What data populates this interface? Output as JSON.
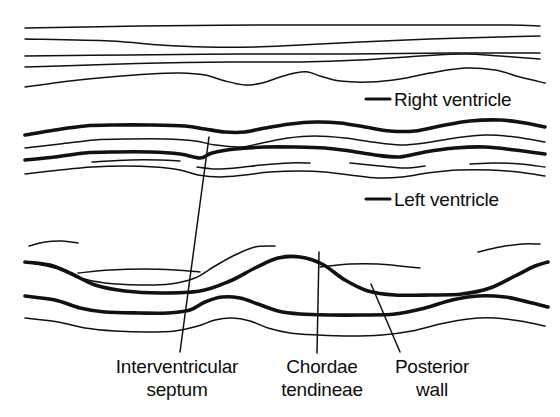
{
  "figure": {
    "kind": "m-mode-echocardiogram-tracing",
    "background_color": "#ffffff",
    "ink_color": "#111111"
  },
  "legend_labels": [
    {
      "id": "right-ventricle",
      "text": "Right ventricle",
      "leader": "horizontal-dash"
    },
    {
      "id": "left-ventricle",
      "text": "Left ventricle",
      "leader": "horizontal-dash"
    }
  ],
  "callout_labels": [
    {
      "id": "interventricular-septum",
      "line1": "Interventricular",
      "line2": "septum",
      "leader": "diagonal-up-right"
    },
    {
      "id": "chordae-tendineae",
      "line1": "Chordae",
      "line2": "tendineae",
      "leader": "vertical"
    },
    {
      "id": "posterior-wall",
      "line1": "Posterior",
      "line2": "wall",
      "leader": "diagonal-up-left"
    }
  ],
  "chart_data": {
    "type": "line",
    "title": "",
    "xlabel": "",
    "ylabel": "",
    "xlim": [
      0,
      560
    ],
    "ylim": [
      0,
      417
    ],
    "grid": false,
    "legend_position": "right",
    "series": [
      {
        "name": "chest-wall-echo-1",
        "weight": "thin",
        "points": [
          [
            25,
            28
          ],
          [
            140,
            26
          ],
          [
            260,
            25
          ],
          [
            380,
            25
          ],
          [
            500,
            25
          ],
          [
            540,
            26
          ]
        ]
      },
      {
        "name": "chest-wall-echo-2",
        "weight": "thin",
        "points": [
          [
            25,
            39
          ],
          [
            110,
            41
          ],
          [
            160,
            45
          ],
          [
            205,
            47
          ],
          [
            255,
            47
          ],
          [
            300,
            45
          ],
          [
            360,
            42
          ],
          [
            430,
            39
          ],
          [
            500,
            37
          ],
          [
            540,
            36
          ]
        ]
      },
      {
        "name": "right-ventricle-anterior-wall",
        "weight": "thin",
        "points": [
          [
            25,
            56
          ],
          [
            130,
            55
          ],
          [
            240,
            54
          ],
          [
            350,
            54
          ],
          [
            450,
            53
          ],
          [
            540,
            53
          ]
        ]
      },
      {
        "name": "right-ventricle-cavity-echo",
        "weight": "thin",
        "points": [
          [
            25,
            67
          ],
          [
            90,
            65
          ],
          [
            160,
            63
          ],
          [
            230,
            62
          ],
          [
            300,
            62
          ],
          [
            360,
            60
          ],
          [
            420,
            56
          ],
          [
            465,
            54
          ],
          [
            500,
            56
          ],
          [
            540,
            59
          ]
        ]
      },
      {
        "name": "interventricular-septum-upper",
        "weight": "thin",
        "points": [
          [
            25,
            87
          ],
          [
            70,
            81
          ],
          [
            110,
            77
          ],
          [
            150,
            74
          ],
          [
            180,
            73
          ],
          [
            205,
            75
          ],
          [
            225,
            81
          ],
          [
            245,
            85
          ],
          [
            262,
            83
          ],
          [
            280,
            77
          ],
          [
            295,
            73
          ],
          [
            308,
            72
          ],
          [
            320,
            76
          ],
          [
            340,
            81
          ],
          [
            370,
            82
          ],
          [
            400,
            79
          ],
          [
            430,
            73
          ],
          [
            465,
            68
          ],
          [
            495,
            70
          ],
          [
            520,
            77
          ],
          [
            545,
            83
          ]
        ]
      },
      {
        "name": "lv-posterior-septum-thick",
        "weight": "thick",
        "points": [
          [
            25,
            135
          ],
          [
            55,
            130
          ],
          [
            85,
            126
          ],
          [
            115,
            125
          ],
          [
            150,
            125
          ],
          [
            185,
            126
          ],
          [
            205,
            129
          ],
          [
            225,
            132
          ],
          [
            245,
            132
          ],
          [
            265,
            128
          ],
          [
            290,
            124
          ],
          [
            315,
            122
          ],
          [
            340,
            123
          ],
          [
            365,
            127
          ],
          [
            390,
            131
          ],
          [
            415,
            131
          ],
          [
            440,
            126
          ],
          [
            470,
            121
          ],
          [
            500,
            120
          ],
          [
            525,
            123
          ],
          [
            545,
            127
          ]
        ]
      },
      {
        "name": "lv-septum-echo-thin",
        "weight": "thin",
        "points": [
          [
            25,
            148
          ],
          [
            60,
            144
          ],
          [
            95,
            140
          ],
          [
            130,
            139
          ],
          [
            165,
            139
          ],
          [
            195,
            141
          ],
          [
            215,
            145
          ],
          [
            240,
            147
          ],
          [
            262,
            143
          ],
          [
            288,
            138
          ],
          [
            315,
            136
          ],
          [
            345,
            138
          ],
          [
            372,
            142
          ],
          [
            400,
            145
          ],
          [
            425,
            143
          ],
          [
            455,
            138
          ],
          [
            485,
            135
          ],
          [
            515,
            137
          ],
          [
            545,
            142
          ]
        ]
      },
      {
        "name": "lv-chordae-thick",
        "weight": "thick",
        "points": [
          [
            25,
            160
          ],
          [
            55,
            157
          ],
          [
            85,
            153
          ],
          [
            115,
            152
          ],
          [
            150,
            152
          ],
          [
            180,
            154
          ],
          [
            200,
            158
          ],
          [
            212,
            153
          ],
          [
            235,
            149
          ],
          [
            265,
            147
          ],
          [
            295,
            147
          ],
          [
            325,
            148
          ],
          [
            350,
            151
          ],
          [
            375,
            155
          ],
          [
            400,
            157
          ],
          [
            425,
            152
          ],
          [
            455,
            148
          ],
          [
            485,
            147
          ],
          [
            515,
            150
          ],
          [
            545,
            154
          ]
        ]
      },
      {
        "name": "lv-posterior-thin-a",
        "weight": "thin",
        "points": [
          [
            92,
            162
          ],
          [
            130,
            160
          ],
          [
            160,
            160
          ],
          [
            180,
            161
          ]
        ]
      },
      {
        "name": "lv-posterior-thin-b",
        "weight": "thin",
        "points": [
          [
            197,
            167
          ],
          [
            215,
            169
          ],
          [
            235,
            168
          ],
          [
            262,
            165
          ],
          [
            290,
            163
          ],
          [
            310,
            163
          ]
        ]
      },
      {
        "name": "lv-posterior-thin-c",
        "weight": "thin",
        "points": [
          [
            350,
            163
          ],
          [
            380,
            166
          ],
          [
            405,
            168
          ],
          [
            425,
            166
          ]
        ]
      },
      {
        "name": "lv-posterior-thin-d",
        "weight": "thin",
        "points": [
          [
            470,
            164
          ],
          [
            495,
            163
          ],
          [
            520,
            164
          ],
          [
            545,
            167
          ]
        ]
      },
      {
        "name": "lv-lower-boundary-thin",
        "weight": "thin",
        "points": [
          [
            25,
            174
          ],
          [
            60,
            170
          ],
          [
            92,
            167
          ],
          [
            125,
            166
          ],
          [
            155,
            167
          ],
          [
            180,
            170
          ],
          [
            198,
            175
          ],
          [
            220,
            177
          ],
          [
            245,
            175
          ],
          [
            270,
            172
          ],
          [
            300,
            171
          ],
          [
            325,
            172
          ],
          [
            350,
            175
          ],
          [
            378,
            178
          ],
          [
            402,
            177
          ],
          [
            428,
            173
          ],
          [
            458,
            170
          ],
          [
            490,
            170
          ],
          [
            518,
            172
          ],
          [
            545,
            176
          ]
        ]
      },
      {
        "name": "septum-upper-fragment-a",
        "weight": "thin",
        "points": [
          [
            29,
            246
          ],
          [
            45,
            242
          ],
          [
            62,
            241
          ],
          [
            78,
            243
          ]
        ]
      },
      {
        "name": "septum-thin-upper",
        "weight": "thin",
        "points": [
          [
            25,
            262
          ],
          [
            55,
            268
          ],
          [
            80,
            278
          ],
          [
            105,
            283
          ],
          [
            140,
            285
          ],
          [
            170,
            284
          ],
          [
            195,
            278
          ],
          [
            215,
            266
          ],
          [
            235,
            255
          ],
          [
            255,
            247
          ],
          [
            275,
            246
          ]
        ]
      },
      {
        "name": "septum-thin-mid-fragment",
        "weight": "thin",
        "points": [
          [
            78,
            273
          ],
          [
            110,
            270
          ],
          [
            145,
            269
          ],
          [
            175,
            270
          ],
          [
            200,
            272
          ]
        ]
      },
      {
        "name": "interventricular-septum-thick",
        "weight": "thick",
        "points": [
          [
            25,
            262
          ],
          [
            50,
            265
          ],
          [
            72,
            274
          ],
          [
            95,
            285
          ],
          [
            125,
            291
          ],
          [
            160,
            293
          ],
          [
            200,
            291
          ],
          [
            230,
            281
          ],
          [
            255,
            268
          ],
          [
            278,
            258
          ],
          [
            300,
            257
          ],
          [
            322,
            264
          ],
          [
            345,
            280
          ],
          [
            368,
            291
          ],
          [
            395,
            295
          ],
          [
            430,
            295
          ],
          [
            462,
            294
          ],
          [
            490,
            288
          ],
          [
            515,
            276
          ],
          [
            535,
            266
          ],
          [
            548,
            262
          ]
        ]
      },
      {
        "name": "septum-echo-fragment-right",
        "weight": "thin",
        "points": [
          [
            320,
            267
          ],
          [
            350,
            264
          ],
          [
            378,
            264
          ],
          [
            400,
            266
          ],
          [
            420,
            268
          ]
        ]
      },
      {
        "name": "septum-echo-fragment-far-right",
        "weight": "thin",
        "points": [
          [
            478,
            252
          ],
          [
            500,
            247
          ],
          [
            522,
            244
          ],
          [
            540,
            244
          ]
        ]
      },
      {
        "name": "chordae-thick-lower",
        "weight": "thick",
        "points": [
          [
            25,
            296
          ],
          [
            55,
            300
          ],
          [
            80,
            308
          ],
          [
            105,
            312
          ],
          [
            140,
            313
          ],
          [
            168,
            313
          ],
          [
            190,
            310
          ],
          [
            205,
            302
          ],
          [
            222,
            297
          ],
          [
            240,
            298
          ],
          [
            258,
            304
          ],
          [
            278,
            311
          ],
          [
            300,
            314
          ],
          [
            330,
            315
          ],
          [
            362,
            315
          ],
          [
            395,
            314
          ],
          [
            425,
            308
          ],
          [
            452,
            300
          ],
          [
            478,
            296
          ],
          [
            505,
            297
          ],
          [
            528,
            302
          ],
          [
            548,
            307
          ]
        ]
      },
      {
        "name": "posterior-wall-thin",
        "weight": "thin",
        "points": [
          [
            25,
            318
          ],
          [
            58,
            322
          ],
          [
            85,
            328
          ],
          [
            115,
            331
          ],
          [
            148,
            332
          ],
          [
            175,
            331
          ],
          [
            198,
            326
          ],
          [
            215,
            320
          ],
          [
            232,
            318
          ],
          [
            250,
            321
          ],
          [
            268,
            328
          ],
          [
            290,
            333
          ],
          [
            318,
            335
          ],
          [
            350,
            336
          ],
          [
            382,
            335
          ],
          [
            412,
            331
          ],
          [
            440,
            324
          ],
          [
            468,
            319
          ],
          [
            495,
            318
          ],
          [
            520,
            321
          ],
          [
            545,
            326
          ]
        ]
      }
    ],
    "leaders": [
      {
        "name": "right-ventricle-leader",
        "from": [
          366,
          99
        ],
        "to": [
          390,
          99
        ],
        "weight": "thick"
      },
      {
        "name": "left-ventricle-leader",
        "from": [
          366,
          199
        ],
        "to": [
          390,
          199
        ],
        "weight": "thick"
      },
      {
        "name": "interventricular-septum-leader",
        "from": [
          209,
          137
        ],
        "to": [
          180,
          352
        ],
        "weight": "thin"
      },
      {
        "name": "chordae-tendineae-leader",
        "from": [
          319,
          252
        ],
        "to": [
          317,
          353
        ],
        "weight": "thin"
      },
      {
        "name": "posterior-wall-leader",
        "from": [
          371,
          284
        ],
        "to": [
          400,
          352
        ],
        "weight": "thin"
      }
    ]
  }
}
